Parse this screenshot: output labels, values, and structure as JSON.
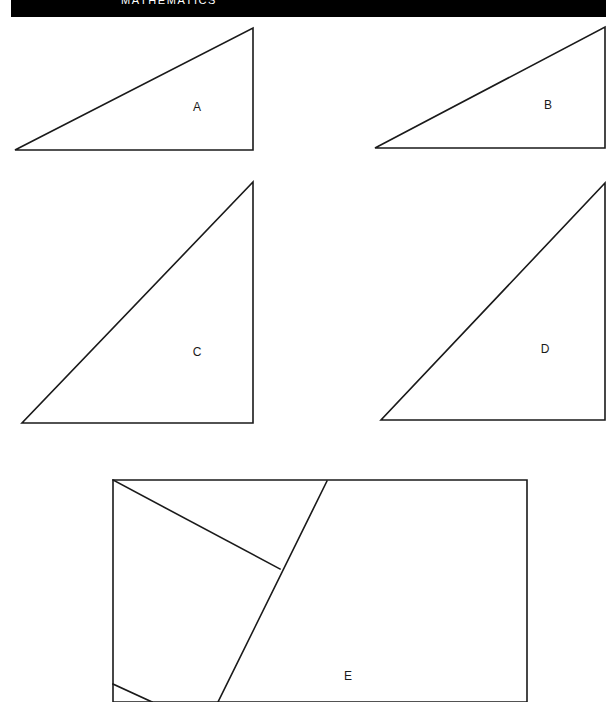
{
  "header": {
    "title": "MATHEMATICS",
    "background_color": "#000000",
    "text_color": "#ffffff"
  },
  "page": {
    "background_color": "#ffffff",
    "stroke_color": "#1a1a1a",
    "width": 614,
    "height": 702
  },
  "figures": [
    {
      "id": "figure-a",
      "label": "A",
      "shape": "right-triangle",
      "label_x": 197,
      "label_y": 107,
      "outline_points": "15,150 253,150 253,28",
      "cuts": []
    },
    {
      "id": "figure-b",
      "label": "B",
      "shape": "right-triangle",
      "label_x": 548,
      "label_y": 105,
      "outline_points": "375,148 605,148 605,27",
      "cuts": []
    },
    {
      "id": "figure-c",
      "label": "C",
      "shape": "right-triangle",
      "label_x": 197,
      "label_y": 352,
      "outline_points": "22,423 253,423 253,182",
      "cuts": []
    },
    {
      "id": "figure-d",
      "label": "D",
      "shape": "right-triangle",
      "label_x": 545,
      "label_y": 349,
      "outline_points": "381,420 605,420 605,183",
      "cuts": []
    },
    {
      "id": "figure-e",
      "label": "E",
      "shape": "dissected-rectangle",
      "label_x": 348,
      "label_y": 676,
      "outline_points": "113,480 527,480 527,702 113,702",
      "cuts": [
        "M113,480 L280,569",
        "M327,481 L218,702",
        "M113,684 L152,702"
      ]
    }
  ]
}
